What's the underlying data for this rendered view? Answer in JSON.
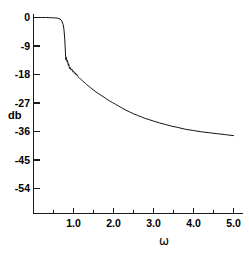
{
  "figure": {
    "background_color": "#ffffff",
    "curve_color": "#111111",
    "axis_color": "#1a1a1a"
  },
  "chart_data": {
    "type": "line",
    "title": "",
    "subtitle": "",
    "xlabel": "ω",
    "ylabel": "db",
    "xlim": [
      0.0,
      5.2
    ],
    "ylim": [
      -58.5,
      1.5
    ],
    "grid": false,
    "legend": null,
    "x_ticks": [
      1.0,
      2.0,
      3.0,
      4.0,
      5.0
    ],
    "x_tick_labels": [
      "1.0",
      "2.0",
      "3.0",
      "4.0",
      "5.0"
    ],
    "x_minor_ticks": [
      0.5,
      1.5,
      2.5,
      3.5,
      4.5
    ],
    "y_ticks": [
      0,
      -9,
      -18,
      -27,
      -36,
      -45,
      -54
    ],
    "y_tick_labels": [
      "0",
      "-9",
      "-18",
      "-27",
      "-36",
      "-45",
      "-54"
    ],
    "annotations": [],
    "series": [
      {
        "name": "magnitude response",
        "x": [
          0.02,
          0.1,
          0.2,
          0.3,
          0.4,
          0.5,
          0.6,
          0.66,
          0.7,
          0.74,
          0.76,
          0.78,
          0.79,
          0.8,
          0.805,
          0.81,
          0.815,
          0.82,
          0.83,
          0.84,
          0.85,
          0.86,
          0.87,
          0.88,
          0.89,
          0.9,
          0.92,
          0.94,
          0.96,
          0.98,
          1.0,
          1.02,
          1.04,
          1.06,
          1.08,
          1.1,
          1.14,
          1.18,
          1.22,
          1.26,
          1.3,
          1.34,
          1.38,
          1.42,
          1.46,
          1.5,
          1.56,
          1.62,
          1.68,
          1.74,
          1.8,
          1.86,
          1.92,
          1.98,
          2.05,
          2.12,
          2.2,
          2.3,
          2.4,
          2.5,
          2.6,
          2.7,
          2.8,
          2.9,
          3.0,
          3.15,
          3.3,
          3.45,
          3.6,
          3.8,
          4.0,
          4.2,
          4.4,
          4.6,
          4.8,
          5.0
        ],
        "y": [
          0.0,
          0.0,
          0.0,
          0.0,
          -0.05,
          -0.1,
          -0.2,
          -0.45,
          -0.9,
          -2.2,
          -3.6,
          -6.5,
          -9.0,
          -11.5,
          -12.6,
          -13.4,
          -13.0,
          -12.6,
          -13.3,
          -14.0,
          -13.6,
          -14.4,
          -15.1,
          -14.6,
          -15.4,
          -16.1,
          -15.8,
          -16.6,
          -16.3,
          -17.1,
          -16.9,
          -17.6,
          -17.4,
          -18.1,
          -17.9,
          -18.5,
          -19.0,
          -19.5,
          -19.9,
          -20.4,
          -20.8,
          -21.3,
          -21.7,
          -22.1,
          -22.5,
          -22.9,
          -23.5,
          -24.0,
          -24.5,
          -25.0,
          -25.5,
          -26.0,
          -26.5,
          -26.9,
          -27.4,
          -27.9,
          -28.5,
          -29.2,
          -29.8,
          -30.4,
          -30.9,
          -31.4,
          -31.9,
          -32.3,
          -32.7,
          -33.3,
          -33.8,
          -34.3,
          -34.7,
          -35.3,
          -35.7,
          -36.1,
          -36.4,
          -36.7,
          -37.0,
          -37.3
        ],
        "ripple": {
          "present": true,
          "region_x": [
            0.8,
            1.15
          ],
          "description": "decaying sawtooth ripple in stopband transition"
        }
      }
    ]
  }
}
